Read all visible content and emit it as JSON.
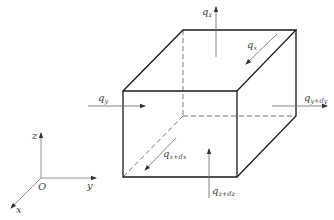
{
  "diagram": {
    "colors": {
      "edge": "#1a1a1a",
      "hidden_edge": "#555555",
      "arrow": "#555555",
      "label": "#444444",
      "background": "#ffffff"
    },
    "cube": {
      "front_top_left": [
        123,
        91
      ],
      "front_top_right": [
        237,
        91
      ],
      "front_bottom_left": [
        123,
        177
      ],
      "front_bottom_right": [
        237,
        177
      ],
      "back_top_left": [
        183,
        30
      ],
      "back_top_right": [
        296,
        30
      ],
      "back_bottom_left": [
        183,
        116
      ],
      "back_bottom_right": [
        296,
        116
      ]
    },
    "flux_labels": {
      "qz": {
        "base": "q",
        "sub": "z"
      },
      "qx": {
        "base": "q",
        "sub": "x"
      },
      "qy": {
        "base": "q",
        "sub": "y"
      },
      "qydy": {
        "base": "q",
        "sub": "y+dy"
      },
      "qxdx": {
        "base": "q",
        "sub": "x+dx"
      },
      "qzdz": {
        "base": "q",
        "sub": "z+dz"
      }
    },
    "axes": {
      "origin_label": "O",
      "x_label": "x",
      "y_label": "y",
      "z_label": "z"
    }
  }
}
